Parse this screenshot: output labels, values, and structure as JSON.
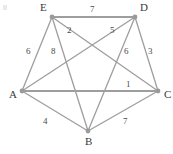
{
  "figure": {
    "width": 173,
    "height": 154,
    "background_color": "#ffffff",
    "edge_color": "#9e9e9e",
    "node_color": "#9a9a9a",
    "label_color": "#3a3a3a",
    "corner_artifact": ""
  },
  "chart_data": {
    "type": "diagram",
    "diagram_type": "weighted-undirected-graph",
    "title": "",
    "directed": false,
    "nodes": [
      {
        "id": "A",
        "label": "A",
        "x": 22,
        "y": 91,
        "label_dx": -13,
        "label_dy": 4
      },
      {
        "id": "B",
        "label": "B",
        "x": 88,
        "y": 131,
        "label_dx": -3,
        "label_dy": 11
      },
      {
        "id": "C",
        "label": "C",
        "x": 158,
        "y": 91,
        "label_dx": 6,
        "label_dy": 4
      },
      {
        "id": "D",
        "label": "D",
        "x": 135,
        "y": 17,
        "label_dx": 5,
        "label_dy": -9
      },
      {
        "id": "E",
        "label": "E",
        "x": 52,
        "y": 17,
        "label_dx": -12,
        "label_dy": -9
      }
    ],
    "edges": [
      {
        "source": "E",
        "target": "D",
        "weight": 7,
        "label": "7",
        "label_x": 90,
        "label_y": 5,
        "thick": true
      },
      {
        "source": "E",
        "target": "C",
        "weight": 2,
        "label": "2",
        "label_x": 67,
        "label_y": 26,
        "thick": false
      },
      {
        "source": "D",
        "target": "A",
        "weight": 5,
        "label": "5",
        "label_x": 110,
        "label_y": 26,
        "thick": false
      },
      {
        "source": "A",
        "target": "E",
        "weight": 6,
        "label": "6",
        "label_x": 26,
        "label_y": 47,
        "thick": false
      },
      {
        "source": "E",
        "target": "B",
        "weight": 8,
        "label": "8",
        "label_x": 51,
        "label_y": 47,
        "thick": false
      },
      {
        "source": "D",
        "target": "B",
        "weight": 6,
        "label": "6",
        "label_x": 124,
        "label_y": 47,
        "thick": false
      },
      {
        "source": "D",
        "target": "C",
        "weight": 3,
        "label": "3",
        "label_x": 148,
        "label_y": 47,
        "thick": false
      },
      {
        "source": "A",
        "target": "C",
        "weight": 1,
        "label": "1",
        "label_x": 126,
        "label_y": 80,
        "thick": true
      },
      {
        "source": "A",
        "target": "B",
        "weight": 4,
        "label": "4",
        "label_x": 43,
        "label_y": 117,
        "thick": false
      },
      {
        "source": "B",
        "target": "C",
        "weight": 7,
        "label": "7",
        "label_x": 123,
        "label_y": 117,
        "thick": false
      }
    ],
    "node_count": 5,
    "edge_count": 10,
    "weights": [
      7,
      2,
      5,
      6,
      8,
      6,
      3,
      1,
      4,
      7
    ]
  }
}
